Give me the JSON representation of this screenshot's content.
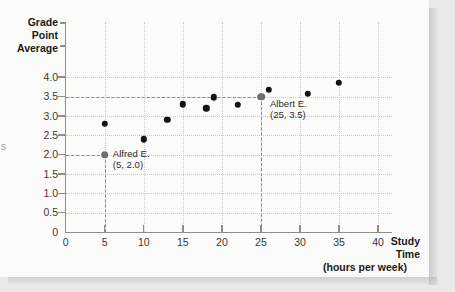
{
  "figure": {
    "background": "#fbfbfa",
    "page_background": "#e9e9e7",
    "edge_artifact": "s"
  },
  "axes": {
    "y_title_lines": [
      "Grade",
      "Point",
      "Average"
    ],
    "x_title_lines": [
      "Study",
      "Time"
    ],
    "x_units": "(hours per week)",
    "y_ticks": [
      "4.0",
      "3.5",
      "3.0",
      "2.5",
      "2.0",
      "1.5",
      "1.0",
      "0.5",
      "0"
    ],
    "x_ticks": [
      "0",
      "5",
      "10",
      "15",
      "20",
      "25",
      "30",
      "35",
      "40"
    ]
  },
  "annotations": [
    {
      "name": "Alfred E.",
      "coords": "(5, 2.0)"
    },
    {
      "name": "Albert E.",
      "coords": "(25, 3.5)"
    }
  ],
  "chart_data": {
    "type": "scatter",
    "title": "",
    "xlabel": "Study Time (hours per week)",
    "ylabel": "Grade Point Average",
    "xlim": [
      0,
      40
    ],
    "ylim": [
      0,
      4.25
    ],
    "xticks": [
      0,
      5,
      10,
      15,
      20,
      25,
      30,
      35,
      40
    ],
    "yticks": [
      0.5,
      1.0,
      1.5,
      2.0,
      2.5,
      3.0,
      3.5,
      4.0
    ],
    "grid": true,
    "legend": "none",
    "points": [
      {
        "x": 5,
        "y": 2.0,
        "label": "Alfred E.",
        "highlight": true
      },
      {
        "x": 5,
        "y": 2.8,
        "label": "",
        "highlight": false
      },
      {
        "x": 10,
        "y": 2.4,
        "label": "",
        "highlight": false
      },
      {
        "x": 13,
        "y": 2.9,
        "label": "",
        "highlight": false
      },
      {
        "x": 15,
        "y": 3.3,
        "label": "",
        "highlight": false
      },
      {
        "x": 18,
        "y": 3.2,
        "label": "",
        "highlight": false
      },
      {
        "x": 19,
        "y": 3.48,
        "label": "",
        "highlight": false
      },
      {
        "x": 22,
        "y": 3.28,
        "label": "",
        "highlight": false
      },
      {
        "x": 25,
        "y": 3.5,
        "label": "Albert E.",
        "highlight": true
      },
      {
        "x": 26,
        "y": 3.67,
        "label": "",
        "highlight": false
      },
      {
        "x": 31,
        "y": 3.57,
        "label": "",
        "highlight": false
      },
      {
        "x": 35,
        "y": 3.85,
        "label": "",
        "highlight": false
      }
    ],
    "guides": [
      {
        "for": "Alfred E.",
        "x": 5,
        "y": 2.0
      },
      {
        "for": "Albert E.",
        "x": 25,
        "y": 3.5
      }
    ]
  }
}
